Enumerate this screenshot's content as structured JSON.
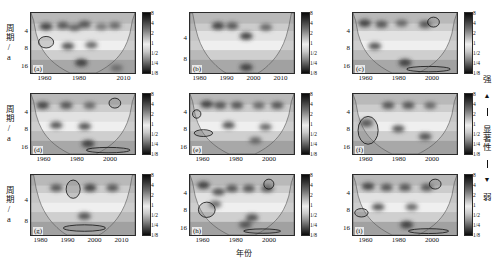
{
  "figure": {
    "y_axis_label": "周期/a",
    "x_axis_label": "年份",
    "caption": ""
  },
  "significance_legend": {
    "strong_label": "强",
    "weak_label": "弱",
    "axis_label": "显著性",
    "up_arrow": "▲",
    "down_arrow": "▼"
  },
  "colorbar": {
    "ticks": [
      "8",
      "4",
      "2",
      "1",
      "1/2",
      "1/4",
      "1/8"
    ],
    "high_color": "#0a0a0a",
    "mid_color": "#ededed",
    "low_color": "#0a0a0a"
  },
  "chart_data": {
    "type": "heatmap",
    "title": "",
    "xlabel": "年份",
    "ylabel": "周期/a",
    "grid": false,
    "legend_position": "right",
    "colorbar_ticks": [
      "8",
      "4",
      "2",
      "1",
      "1/2",
      "1/4",
      "1/8"
    ],
    "panels": [
      {
        "tag": "(a)",
        "row": 0,
        "col": 0,
        "xticks": [
          "1960",
          "1980",
          "2010"
        ],
        "xtick_pos": [
          0.14,
          0.47,
          0.9
        ],
        "yticks": [
          "4",
          "8",
          "16"
        ],
        "ytick_pos": [
          0.33,
          0.62,
          0.92
        ],
        "xlim": [
          1953,
          2015
        ],
        "ylim_periods": [
          1,
          22
        ],
        "significant_regions": [
          {
            "center_year": 1962,
            "center_period": 4.5,
            "width_years": 9,
            "height_periods": 2.6
          }
        ],
        "high_power_blobs": [
          {
            "year": 1962,
            "period": 2.0,
            "intensity": 0.95
          },
          {
            "year": 1972,
            "period": 1.9,
            "intensity": 0.9
          },
          {
            "year": 1979,
            "period": 2.1,
            "intensity": 0.85
          },
          {
            "year": 1985,
            "period": 1.8,
            "intensity": 0.9
          },
          {
            "year": 1995,
            "period": 2.0,
            "intensity": 0.8
          },
          {
            "year": 2003,
            "period": 1.9,
            "intensity": 0.85
          },
          {
            "year": 1975,
            "period": 5.5,
            "intensity": 0.9
          },
          {
            "year": 1989,
            "period": 5.2,
            "intensity": 0.85
          },
          {
            "year": 1983,
            "period": 13.0,
            "intensity": 0.95
          },
          {
            "year": 2004,
            "period": 17.0,
            "intensity": 0.9
          }
        ]
      },
      {
        "tag": "(b)",
        "row": 0,
        "col": 1,
        "xticks": [
          "1980",
          "1990",
          "2000",
          "2010"
        ],
        "xtick_pos": [
          0.1,
          0.36,
          0.62,
          0.88
        ],
        "yticks": [
          "4",
          "8"
        ],
        "ytick_pos": [
          0.45,
          0.8
        ],
        "xlim": [
          1977,
          2014
        ],
        "ylim_periods": [
          1,
          12
        ],
        "significant_regions": [],
        "high_power_blobs": [
          {
            "year": 1987,
            "period": 1.7,
            "intensity": 0.95
          },
          {
            "year": 1992,
            "period": 1.7,
            "intensity": 0.9
          },
          {
            "year": 1997,
            "period": 2.6,
            "intensity": 0.95
          },
          {
            "year": 2004,
            "period": 1.8,
            "intensity": 0.85
          },
          {
            "year": 1997,
            "period": 9.5,
            "intensity": 0.95
          }
        ]
      },
      {
        "tag": "(c)",
        "row": 0,
        "col": 2,
        "xticks": [
          "1960",
          "1980",
          "2000"
        ],
        "xtick_pos": [
          0.13,
          0.45,
          0.77
        ],
        "yticks": [
          "4",
          "8",
          "16"
        ],
        "ytick_pos": [
          0.33,
          0.62,
          0.92
        ],
        "xlim": [
          1953,
          2015
        ],
        "ylim_periods": [
          1,
          22
        ],
        "significant_regions": [
          {
            "center_year": 2001,
            "center_period": 1.6,
            "width_years": 7,
            "height_periods": 0.8
          },
          {
            "center_year": 1998,
            "center_period": 18.0,
            "width_years": 26,
            "height_periods": 5.0
          }
        ],
        "high_power_blobs": [
          {
            "year": 1960,
            "period": 1.7,
            "intensity": 0.95
          },
          {
            "year": 1970,
            "period": 1.8,
            "intensity": 0.9
          },
          {
            "year": 1982,
            "period": 1.7,
            "intensity": 0.85
          },
          {
            "year": 1996,
            "period": 1.8,
            "intensity": 0.9
          },
          {
            "year": 1966,
            "period": 5.5,
            "intensity": 0.9
          },
          {
            "year": 1984,
            "period": 13.0,
            "intensity": 0.95
          }
        ]
      },
      {
        "tag": "(d)",
        "row": 1,
        "col": 0,
        "xticks": [
          "1960",
          "1980",
          "2000"
        ],
        "xtick_pos": [
          0.13,
          0.45,
          0.77
        ],
        "yticks": [
          "4",
          "8",
          "16"
        ],
        "ytick_pos": [
          0.33,
          0.62,
          0.92
        ],
        "xlim": [
          1953,
          2015
        ],
        "ylim_periods": [
          1,
          22
        ],
        "significant_regions": [
          {
            "center_year": 2003,
            "center_period": 1.6,
            "width_years": 7,
            "height_periods": 0.8
          },
          {
            "center_year": 1999,
            "center_period": 18.0,
            "width_years": 26,
            "height_periods": 5.0
          }
        ],
        "high_power_blobs": [
          {
            "year": 1960,
            "period": 1.8,
            "intensity": 0.95
          },
          {
            "year": 1974,
            "period": 1.8,
            "intensity": 0.9
          },
          {
            "year": 1988,
            "period": 1.8,
            "intensity": 0.85
          },
          {
            "year": 1968,
            "period": 5.0,
            "intensity": 0.9
          },
          {
            "year": 1985,
            "period": 5.3,
            "intensity": 0.9
          },
          {
            "year": 1987,
            "period": 13.0,
            "intensity": 0.95
          }
        ]
      },
      {
        "tag": "(e)",
        "row": 1,
        "col": 1,
        "xticks": [
          "1960",
          "1980",
          "2000"
        ],
        "xtick_pos": [
          0.13,
          0.45,
          0.77
        ],
        "yticks": [
          "4",
          "8",
          "16"
        ],
        "ytick_pos": [
          0.33,
          0.62,
          0.92
        ],
        "xlim": [
          1953,
          2015
        ],
        "ylim_periods": [
          1,
          22
        ],
        "significant_regions": [
          {
            "center_year": 1957,
            "center_period": 2.8,
            "width_years": 5,
            "height_periods": 1.2
          },
          {
            "center_year": 1961,
            "center_period": 7.5,
            "width_years": 11,
            "height_periods": 2.6
          }
        ],
        "high_power_blobs": [
          {
            "year": 1963,
            "period": 1.7,
            "intensity": 0.95
          },
          {
            "year": 1971,
            "period": 1.8,
            "intensity": 0.9
          },
          {
            "year": 1981,
            "period": 1.8,
            "intensity": 0.9
          },
          {
            "year": 1994,
            "period": 1.8,
            "intensity": 0.85
          },
          {
            "year": 2005,
            "period": 1.8,
            "intensity": 0.9
          },
          {
            "year": 1976,
            "period": 5.0,
            "intensity": 0.9
          },
          {
            "year": 1998,
            "period": 5.5,
            "intensity": 0.85
          },
          {
            "year": 1992,
            "period": 11.0,
            "intensity": 0.85
          }
        ]
      },
      {
        "tag": "(f)",
        "row": 1,
        "col": 2,
        "xticks": [
          "1960",
          "1980",
          "2000"
        ],
        "xtick_pos": [
          0.13,
          0.45,
          0.77
        ],
        "yticks": [
          "4",
          "8",
          "16"
        ],
        "ytick_pos": [
          0.33,
          0.62,
          0.92
        ],
        "xlim": [
          1953,
          2015
        ],
        "ylim_periods": [
          1,
          22
        ],
        "significant_regions": [
          {
            "center_year": 1962,
            "center_period": 6.5,
            "width_years": 12,
            "height_periods": 8.0
          }
        ],
        "high_power_blobs": [
          {
            "year": 1961,
            "period": 4.5,
            "intensity": 0.95
          },
          {
            "year": 1974,
            "period": 1.8,
            "intensity": 0.9
          },
          {
            "year": 1986,
            "period": 1.8,
            "intensity": 0.9
          },
          {
            "year": 1999,
            "period": 1.8,
            "intensity": 0.85
          },
          {
            "year": 1980,
            "period": 6.0,
            "intensity": 0.9
          },
          {
            "year": 1996,
            "period": 9.0,
            "intensity": 0.9
          }
        ]
      },
      {
        "tag": "(g)",
        "row": 2,
        "col": 0,
        "xticks": [
          "1980",
          "1990",
          "2000",
          "2010"
        ],
        "xtick_pos": [
          0.1,
          0.36,
          0.62,
          0.88
        ],
        "yticks": [
          "4",
          "8"
        ],
        "ytick_pos": [
          0.45,
          0.8
        ],
        "xlim": [
          1977,
          2014
        ],
        "ylim_periods": [
          1,
          12
        ],
        "significant_regions": [
          {
            "center_year": 1992,
            "center_period": 1.8,
            "width_years": 5,
            "height_periods": 1.3
          },
          {
            "center_year": 1996,
            "center_period": 9.0,
            "width_years": 15,
            "height_periods": 2.4
          }
        ],
        "high_power_blobs": [
          {
            "year": 1986,
            "period": 1.7,
            "intensity": 0.9
          },
          {
            "year": 1998,
            "period": 1.7,
            "intensity": 0.95
          },
          {
            "year": 2006,
            "period": 1.7,
            "intensity": 0.9
          },
          {
            "year": 1996,
            "period": 5.5,
            "intensity": 0.9
          }
        ]
      },
      {
        "tag": "(h)",
        "row": 2,
        "col": 1,
        "xticks": [
          "1960",
          "1980",
          "2000"
        ],
        "xtick_pos": [
          0.13,
          0.45,
          0.77
        ],
        "yticks": [
          "4",
          "8",
          "16"
        ],
        "ytick_pos": [
          0.33,
          0.62,
          0.92
        ],
        "xlim": [
          1953,
          2015
        ],
        "ylim_periods": [
          1,
          22
        ],
        "significant_regions": [
          {
            "center_year": 1963,
            "center_period": 6.0,
            "width_years": 10,
            "height_periods": 4.5
          },
          {
            "center_year": 2000,
            "center_period": 1.6,
            "width_years": 6,
            "height_periods": 0.8
          },
          {
            "center_year": 1996,
            "center_period": 18.0,
            "width_years": 22,
            "height_periods": 4.0
          }
        ],
        "high_power_blobs": [
          {
            "year": 1961,
            "period": 1.7,
            "intensity": 0.95
          },
          {
            "year": 1970,
            "period": 2.4,
            "intensity": 0.9
          },
          {
            "year": 1978,
            "period": 2.0,
            "intensity": 0.9
          },
          {
            "year": 1988,
            "period": 2.0,
            "intensity": 0.9
          },
          {
            "year": 1999,
            "period": 2.0,
            "intensity": 0.9
          },
          {
            "year": 1968,
            "period": 4.5,
            "intensity": 0.85
          },
          {
            "year": 1990,
            "period": 9.0,
            "intensity": 0.9
          },
          {
            "year": 1986,
            "period": 13.0,
            "intensity": 0.9
          }
        ]
      },
      {
        "tag": "(i)",
        "row": 2,
        "col": 2,
        "xticks": [
          "1960",
          "1980",
          "2000"
        ],
        "xtick_pos": [
          0.13,
          0.45,
          0.77
        ],
        "yticks": [
          "4",
          "8",
          "16"
        ],
        "ytick_pos": [
          0.33,
          0.62,
          0.92
        ],
        "xlim": [
          1953,
          2015
        ],
        "ylim_periods": [
          1,
          22
        ],
        "significant_regions": [
          {
            "center_year": 1958,
            "center_period": 7.0,
            "width_years": 8,
            "height_periods": 3.0
          },
          {
            "center_year": 2002,
            "center_period": 1.6,
            "width_years": 7,
            "height_periods": 0.8
          },
          {
            "center_year": 1998,
            "center_period": 18.0,
            "width_years": 24,
            "height_periods": 4.5
          }
        ],
        "high_power_blobs": [
          {
            "year": 1962,
            "period": 1.8,
            "intensity": 0.95
          },
          {
            "year": 1973,
            "period": 1.9,
            "intensity": 0.9
          },
          {
            "year": 1984,
            "period": 1.9,
            "intensity": 0.9
          },
          {
            "year": 1997,
            "period": 1.9,
            "intensity": 0.9
          },
          {
            "year": 1968,
            "period": 5.2,
            "intensity": 0.9
          },
          {
            "year": 1988,
            "period": 5.2,
            "intensity": 0.85
          },
          {
            "year": 1985,
            "period": 13.0,
            "intensity": 0.95
          }
        ]
      }
    ]
  }
}
